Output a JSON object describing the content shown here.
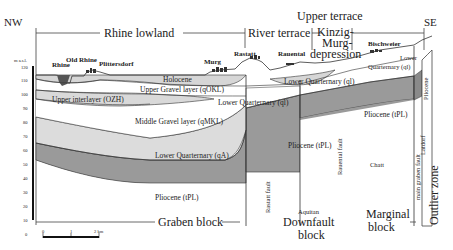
{
  "directions": {
    "left": "NW",
    "right": "SE"
  },
  "regions": {
    "rhine_lowland": "Rhine lowland",
    "river_terrace": "River terrace",
    "upper_terrace": "Upper terrace",
    "kinzig_1": "Kinzig-",
    "kinzig_2": "Murg-",
    "kinzig_3": "depression"
  },
  "towns": {
    "rhine": "Rhine",
    "old_rhine": "Old Rhine",
    "plittersdorf": "Plittersdorf",
    "murg": "Murg",
    "rastatt": "Rastatt",
    "rauental": "Rauental",
    "bischweier": "Bischweier"
  },
  "layers": {
    "holocene": "Holocene",
    "upper_gravel": "Upper Gravel layer (qOKL)",
    "upper_interlayer": "Upper interlayer (OZH)",
    "lower_quaternary_ql_1": "Lower Quarternary (ql)",
    "lower_quaternary_ql_2": "Lower Quarternary (ql)",
    "lower_quaternary_ql_3a": "Lower",
    "lower_quaternary_ql_3b": "Quarternary (ql)",
    "middle_gravel": "Middle Gravel layer (qMKL)",
    "lower_quaternary_qa": "Lower Quarternary (qA)",
    "pliocene_1": "Pliocene (tPL)",
    "pliocene_2": "Pliocene (tPL)",
    "pliocene_3": "Pliocene (tPL)",
    "pliocene_edge": "Pliocene",
    "chatt": "Chatt",
    "aquitan": "Aquitan",
    "latdorf": "Latdorf"
  },
  "faults": {
    "rastatt": "Rastatt fault",
    "rauental": "Rauental fault",
    "main_graben": "main graben fault"
  },
  "blocks": {
    "graben": "Graben block",
    "downfault_1": "Downfault",
    "downfault_2": "block",
    "marginal_1": "Marginal",
    "marginal_2": "block",
    "outlier": "Outlier zone"
  },
  "axis": {
    "unit": "m a.s.l.",
    "ticks": [
      "120",
      "110",
      "100",
      "90",
      "80",
      "70",
      "60",
      "50",
      "40",
      "30",
      "20",
      "10",
      "0"
    ]
  },
  "scale_bar": {
    "labels": [
      "0",
      "1",
      "2 km"
    ]
  },
  "colors": {
    "holocene": "#d6d6d6",
    "upper_gravel": "#ffffff",
    "interlayer": "#d9d9d9",
    "middle_gravel": "#ffffff",
    "lower_qa": "#dcdcdc",
    "pliocene": "#9a9a9a",
    "line": "#333333"
  }
}
